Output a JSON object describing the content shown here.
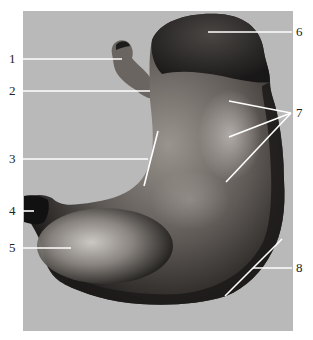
{
  "figure": {
    "background_color": "#b9b9b9",
    "page_color": "#ffffff",
    "line_color": "#ffffff",
    "labels": [
      {
        "id": "1",
        "text": "1",
        "side": "left",
        "y": 59
      },
      {
        "id": "2",
        "text": "2",
        "side": "left",
        "y": 91
      },
      {
        "id": "3",
        "text": "3",
        "side": "left",
        "y": 159
      },
      {
        "id": "4",
        "text": "4",
        "side": "left",
        "y": 211
      },
      {
        "id": "5",
        "text": "5",
        "side": "left",
        "y": 248
      },
      {
        "id": "6",
        "text": "6",
        "side": "right",
        "y": 32
      },
      {
        "id": "7",
        "text": "7",
        "side": "right",
        "y": 113
      },
      {
        "id": "8",
        "text": "8",
        "side": "right",
        "y": 268
      }
    ]
  }
}
